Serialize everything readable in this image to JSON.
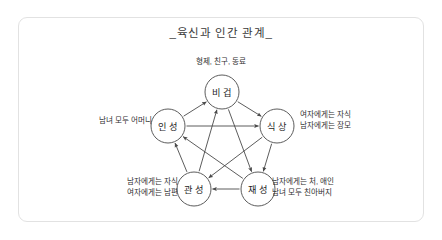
{
  "figure": {
    "title": "_육신과 인간 관계_",
    "frame_color": "#e2e2e2",
    "background_color": "#ffffff",
    "stroke_color": "#4a4a4a",
    "text_color": "#2f2f2f"
  },
  "nodes": [
    {
      "id": "bigyeop",
      "label": "비 겁",
      "cx": 222,
      "cy": 92,
      "r": 17
    },
    {
      "id": "inseong",
      "label": "인 성",
      "cx": 168,
      "cy": 126,
      "r": 17
    },
    {
      "id": "siksang",
      "label": "식 상",
      "cx": 277,
      "cy": 126,
      "r": 17
    },
    {
      "id": "gwanseong",
      "label": "관 성",
      "cx": 194,
      "cy": 189,
      "r": 17
    },
    {
      "id": "jaeseong",
      "label": "재 성",
      "cx": 258,
      "cy": 189,
      "r": 17
    }
  ],
  "edges": [
    {
      "from": "inseong",
      "to": "bigyeop",
      "kind": "outer"
    },
    {
      "from": "bigyeop",
      "to": "siksang",
      "kind": "outer"
    },
    {
      "from": "siksang",
      "to": "jaeseong",
      "kind": "outer"
    },
    {
      "from": "jaeseong",
      "to": "gwanseong",
      "kind": "outer"
    },
    {
      "from": "gwanseong",
      "to": "inseong",
      "kind": "outer"
    },
    {
      "from": "inseong",
      "to": "siksang",
      "kind": "inner"
    },
    {
      "from": "siksang",
      "to": "gwanseong",
      "kind": "inner"
    },
    {
      "from": "gwanseong",
      "to": "bigyeop",
      "kind": "inner"
    },
    {
      "from": "bigyeop",
      "to": "jaeseong",
      "kind": "inner"
    },
    {
      "from": "jaeseong",
      "to": "inseong",
      "kind": "inner"
    }
  ],
  "annotations": {
    "top": "형제, 친구, 동료",
    "left": "남녀 모두 어머니",
    "right_line1": "여자에게는 자식",
    "right_line2": "남자에게는 장모",
    "bottom_left_line1": "남자에게는 자식",
    "bottom_left_line2": "여자에게는 남편",
    "bottom_right_line1": "남자에게는 처, 애인",
    "bottom_right_line2": "남녀 모두 친아버지"
  }
}
